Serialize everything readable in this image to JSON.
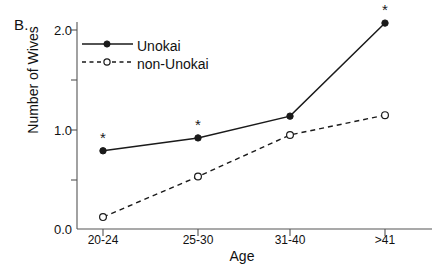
{
  "chart_data": {
    "type": "line",
    "panel_label": "B.",
    "title": "",
    "xlabel": "Age",
    "ylabel": "Number of Wives",
    "categories": [
      "20-24",
      "25-30",
      "31-40",
      ">41"
    ],
    "ylim": [
      0.0,
      2.15
    ],
    "yticks": [
      0.0,
      0.5,
      1.0,
      1.5,
      2.0
    ],
    "ytick_labels": [
      "0.0",
      "",
      "1.0",
      "",
      "2.0"
    ],
    "ytick_labels_major": [
      "0.0",
      "1.0",
      "2.0"
    ],
    "grid": false,
    "legend_position": "top-left",
    "series": [
      {
        "name": "Unokai",
        "values": [
          0.79,
          0.92,
          1.14,
          2.08
        ],
        "line_style": "solid",
        "marker": "filled-circle",
        "color": "#1a1a1a",
        "significance_markers": [
          true,
          true,
          false,
          true
        ],
        "significance_glyph": "*"
      },
      {
        "name": "non-Unokai",
        "values": [
          0.12,
          0.53,
          0.95,
          1.15
        ],
        "line_style": "dashed",
        "marker": "open-circle",
        "color": "#1a1a1a",
        "significance_markers": [
          false,
          false,
          false,
          false
        ],
        "significance_glyph": "*"
      }
    ],
    "annotations": [
      {
        "text": "*",
        "series": "Unokai",
        "category": "20-24"
      },
      {
        "text": "*",
        "series": "Unokai",
        "category": "25-30"
      },
      {
        "text": "*",
        "series": "Unokai",
        "category": ">41"
      }
    ]
  },
  "legend": {
    "items": [
      {
        "label": "Unokai"
      },
      {
        "label": "non-Unokai"
      }
    ]
  }
}
